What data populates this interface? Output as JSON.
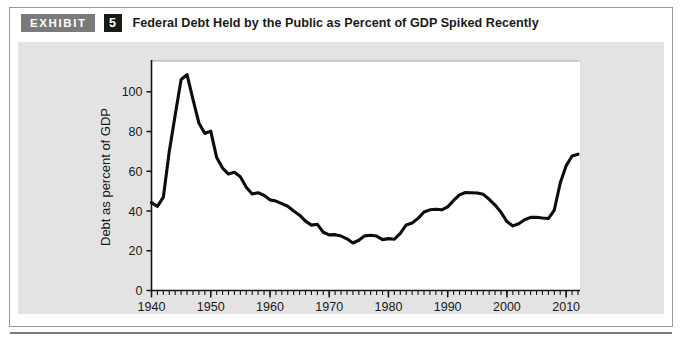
{
  "exhibit": {
    "tag_label": "EXHIBIT",
    "number": "5",
    "title": "Federal Debt Held by the Public as Percent of GDP Spiked Recently"
  },
  "colors": {
    "tag_background": "#7a7a7a",
    "number_background": "#1a1a1a",
    "panel_background": "#e3e3e3",
    "plot_background": "#ffffff",
    "line_color": "#0d0d0d",
    "axis_color": "#151515",
    "rule_color": "#7d7d7d"
  },
  "chart_data": {
    "type": "line",
    "title": "Federal Debt Held by the Public as Percent of GDP Spiked Recently",
    "xlabel": "",
    "ylabel": "Debt as percent of GDP",
    "xlim": [
      1940,
      1012
    ],
    "x_min": 1940,
    "x_max": 2012,
    "ylim": [
      0,
      115
    ],
    "y_min": 0,
    "y_max": 115,
    "grid": false,
    "legend": false,
    "x_ticks_major": [
      1940,
      1950,
      1960,
      1970,
      1980,
      1990,
      2000,
      2010
    ],
    "x_tick_labels": [
      "1940",
      "1950",
      "1960",
      "1970",
      "1980",
      "1990",
      "2000",
      "2010"
    ],
    "x_tick_minor_step": 1,
    "y_ticks": [
      0,
      20,
      40,
      60,
      80,
      100
    ],
    "y_tick_labels": [
      "0",
      "20",
      "40",
      "60",
      "80",
      "100"
    ],
    "series": [
      {
        "name": "Federal debt held by the public as percent of GDP",
        "x": [
          1940,
          1941,
          1942,
          1943,
          1944,
          1945,
          1946,
          1947,
          1948,
          1949,
          1950,
          1951,
          1952,
          1953,
          1954,
          1955,
          1956,
          1957,
          1958,
          1959,
          1960,
          1961,
          1962,
          1963,
          1964,
          1965,
          1966,
          1967,
          1968,
          1969,
          1970,
          1971,
          1972,
          1973,
          1974,
          1975,
          1976,
          1977,
          1978,
          1979,
          1980,
          1981,
          1982,
          1983,
          1984,
          1985,
          1986,
          1987,
          1988,
          1989,
          1990,
          1991,
          1992,
          1993,
          1994,
          1995,
          1996,
          1997,
          1998,
          1999,
          2000,
          2001,
          2002,
          2003,
          2004,
          2005,
          2006,
          2007,
          2008,
          2009,
          2010,
          2011,
          2012
        ],
        "values": [
          44.2,
          42.3,
          47.0,
          70.0,
          88.3,
          106.2,
          108.6,
          96.2,
          84.3,
          79.0,
          80.2,
          66.9,
          61.6,
          58.6,
          59.5,
          57.2,
          52.0,
          48.6,
          49.2,
          47.9,
          45.6,
          45.0,
          43.7,
          42.4,
          40.0,
          37.9,
          34.9,
          32.9,
          33.3,
          29.3,
          28.0,
          28.1,
          27.4,
          26.0,
          23.9,
          25.3,
          27.5,
          27.8,
          27.4,
          25.6,
          26.1,
          25.8,
          28.7,
          33.0,
          34.0,
          36.3,
          39.5,
          40.6,
          40.9,
          40.6,
          42.1,
          45.3,
          48.1,
          49.3,
          49.2,
          49.1,
          48.4,
          45.9,
          43.0,
          39.4,
          34.7,
          32.5,
          33.6,
          35.6,
          36.8,
          36.9,
          36.5,
          36.2,
          40.5,
          54.1,
          62.8,
          67.7,
          68.6
        ]
      }
    ],
    "annotations": []
  }
}
